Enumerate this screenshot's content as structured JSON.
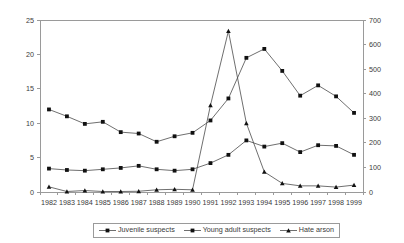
{
  "chart_data": {
    "type": "line",
    "title": "",
    "xlabel": "",
    "ylabel": "",
    "grid": false,
    "legend_position": "bottom-center",
    "categories": [
      "1982",
      "1983",
      "1984",
      "1985",
      "1986",
      "1987",
      "1988",
      "1989",
      "1990",
      "1991",
      "1992",
      "1993",
      "1994",
      "1995",
      "1996",
      "1997",
      "1998",
      "1999"
    ],
    "axes": {
      "left": {
        "label": "",
        "min": 0,
        "max": 25,
        "step": 5,
        "ticks": [
          "0",
          "5",
          "10",
          "15",
          "20",
          "25"
        ]
      },
      "right": {
        "label": "",
        "min": 0,
        "max": 700,
        "step": 100,
        "ticks": [
          "0",
          "100",
          "200",
          "300",
          "400",
          "500",
          "600",
          "700"
        ]
      }
    },
    "series": [
      {
        "name": "Juvenile suspects",
        "axis": "left",
        "marker": "square",
        "values": [
          3.4,
          3.2,
          3.1,
          3.3,
          3.5,
          3.8,
          3.3,
          3.1,
          3.3,
          4.2,
          5.4,
          7.5,
          6.6,
          7.1,
          5.8,
          6.8,
          6.7,
          5.4
        ]
      },
      {
        "name": "Young adult suspects",
        "axis": "left",
        "marker": "square",
        "values": [
          12.0,
          11.0,
          9.9,
          10.2,
          8.7,
          8.5,
          7.3,
          8.1,
          8.6,
          10.4,
          13.6,
          19.5,
          20.8,
          17.6,
          14.0,
          15.5,
          13.9,
          11.5
        ]
      },
      {
        "name": "Hate arson",
        "axis": "right",
        "marker": "triangle",
        "values": [
          21,
          2,
          6,
          2,
          2,
          3,
          9,
          11,
          9,
          353,
          655,
          280,
          82,
          35,
          25,
          25,
          20,
          28
        ]
      }
    ]
  },
  "legend": {
    "items": [
      {
        "label": "Juvenile suspects",
        "marker": "square"
      },
      {
        "label": "Young adult suspects",
        "marker": "square"
      },
      {
        "label": "Hate arson",
        "marker": "triangle"
      }
    ]
  },
  "colors": {
    "line": "#4a4a4a",
    "marker": "#111111",
    "axis": "#9a9a9a",
    "text": "#3a3a3a",
    "background": "#ffffff"
  }
}
